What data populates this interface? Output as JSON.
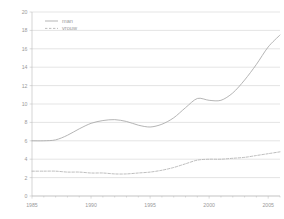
{
  "chart_data": {
    "type": "line",
    "title": "",
    "subtitle": "",
    "xlabel": "",
    "ylabel": "",
    "xlim": [
      1985,
      2006
    ],
    "ylim": [
      0,
      20
    ],
    "grid": true,
    "grid_axis": "y",
    "legend_position": "top-left",
    "y_ticks": [
      0,
      2,
      4,
      6,
      8,
      10,
      12,
      14,
      16,
      18,
      20
    ],
    "y_tick_labels": [
      "0",
      "2",
      "4",
      "6",
      "8",
      "10",
      "12",
      "14",
      "16",
      "18",
      "20"
    ],
    "x_ticks": [
      1985,
      1990,
      1995,
      2000,
      2005
    ],
    "x_tick_labels": [
      "1985",
      "1990",
      "1995",
      "2000",
      "2005"
    ],
    "x_minor_ticks": [
      1986,
      1987,
      1988,
      1989,
      1991,
      1992,
      1993,
      1994,
      1996,
      1997,
      1998,
      1999,
      2001,
      2002,
      2003,
      2004,
      2006
    ],
    "x": [
      1985,
      1986,
      1987,
      1988,
      1989,
      1990,
      1991,
      1992,
      1993,
      1994,
      1995,
      1996,
      1997,
      1998,
      1999,
      2000,
      2001,
      2002,
      2003,
      2004,
      2005,
      2006
    ],
    "series": [
      {
        "name": "man",
        "style": "solid",
        "color": "#a8a8a8",
        "values": [
          6.0,
          6.0,
          6.1,
          6.6,
          7.3,
          7.9,
          8.2,
          8.3,
          8.1,
          7.7,
          7.5,
          7.8,
          8.5,
          9.6,
          10.6,
          10.4,
          10.4,
          11.2,
          12.6,
          14.3,
          16.2,
          17.5
        ]
      },
      {
        "name": "vrouw",
        "style": "dashed",
        "color": "#b0b0b0",
        "values": [
          2.7,
          2.7,
          2.7,
          2.6,
          2.6,
          2.5,
          2.5,
          2.4,
          2.4,
          2.5,
          2.6,
          2.8,
          3.1,
          3.5,
          3.9,
          4.0,
          4.0,
          4.1,
          4.2,
          4.4,
          4.6,
          4.8
        ]
      }
    ]
  },
  "legend": {
    "entries": [
      {
        "label": "man",
        "marker": "solid-line"
      },
      {
        "label": "vrouw",
        "marker": "dashed-line"
      }
    ]
  }
}
